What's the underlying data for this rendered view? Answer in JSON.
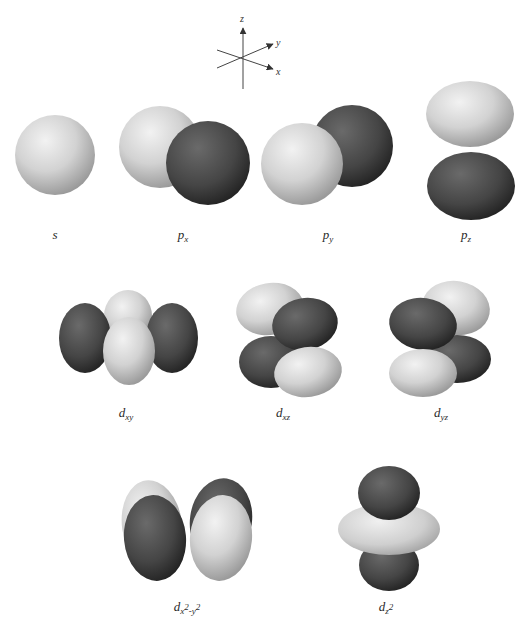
{
  "figure": {
    "title": "",
    "axes": {
      "z": "z",
      "y": "y",
      "x": "x"
    },
    "colors": {
      "positive_lobe": "#d9d9d9",
      "negative_lobe": "#3a3a3a",
      "background": "#ffffff"
    },
    "orbitals": [
      {
        "id": "s",
        "label_main": "s",
        "label_sub": ""
      },
      {
        "id": "px",
        "label_main": "p",
        "label_sub": "x"
      },
      {
        "id": "py",
        "label_main": "p",
        "label_sub": "y"
      },
      {
        "id": "pz",
        "label_main": "p",
        "label_sub": "z"
      },
      {
        "id": "dxy",
        "label_main": "d",
        "label_sub": "xy"
      },
      {
        "id": "dxz",
        "label_main": "d",
        "label_sub": "xz"
      },
      {
        "id": "dyz",
        "label_main": "d",
        "label_sub": "yz"
      },
      {
        "id": "dx2y2",
        "label_main": "d",
        "label_sub_a": "x",
        "label_sup_a": "2",
        "label_sub_sep": "-y",
        "label_sup_b": "2"
      },
      {
        "id": "dz2",
        "label_main": "d",
        "label_sub": "z",
        "label_sup": "2"
      }
    ]
  }
}
